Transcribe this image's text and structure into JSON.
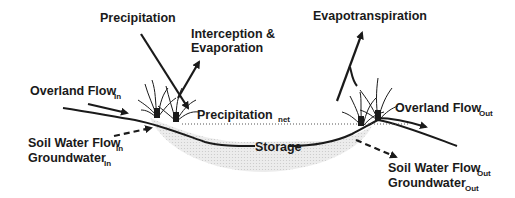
{
  "diagram": {
    "type": "wetland water balance",
    "labels": {
      "precipitation": "Precipitation",
      "interception_line1": "Interception &",
      "interception_line2": "Evaporation",
      "evapotranspiration": "Evapotranspiration",
      "overland_in_main": "Overland Flow",
      "overland_in_sub": "In",
      "soil_in_main": "Soil Water Flow",
      "soil_in_sub": "In",
      "gw_in_main": "Groundwater",
      "gw_in_sub": "In",
      "precip_net_main": "Precipitation",
      "precip_net_sub": "net",
      "storage": "Storage",
      "overland_out_main": "Overland Flow",
      "overland_out_sub": "Out",
      "soil_out_main": "Soil Water Flow",
      "soil_out_sub": "Out",
      "gw_out_main": "Groundwater",
      "gw_out_sub": "Out"
    },
    "colors": {
      "ink": "#1a1a1a",
      "storage_fill": "#e4e4e4",
      "background": "#ffffff"
    }
  }
}
